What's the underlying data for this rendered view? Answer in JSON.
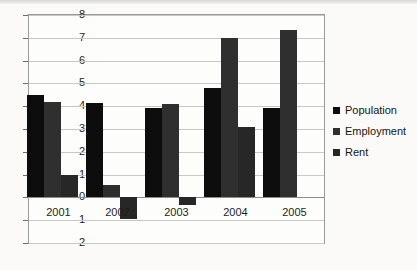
{
  "chart_data": {
    "type": "bar",
    "title": "",
    "subtitle": "",
    "xlabel": "",
    "ylabel": "",
    "categories": [
      "2001",
      "2002",
      "2003",
      "2004",
      "2005"
    ],
    "series": [
      {
        "name": "Population",
        "values": [
          4.5,
          4.15,
          3.9,
          4.8,
          3.9
        ],
        "color": "#0d0d0d"
      },
      {
        "name": "Employment",
        "values": [
          4.2,
          0.55,
          4.1,
          7.0,
          7.35
        ],
        "color": "#2f2f2f"
      },
      {
        "name": "Rent",
        "values": [
          1.0,
          -0.95,
          -0.35,
          3.1,
          0.0
        ],
        "color": "#272727"
      }
    ],
    "ylim": [
      -2,
      8
    ],
    "yticks": [
      8,
      7,
      6,
      5,
      4,
      3,
      2,
      1,
      0,
      -1,
      -2
    ],
    "ytick_labels": [
      "8",
      "7",
      "6",
      "5",
      "4",
      "3",
      "2",
      "1",
      "0",
      "-1",
      "-2"
    ],
    "grid": true,
    "grid_axis": "y",
    "legend_position": "right",
    "bar_grouping": "clustered"
  },
  "legend": {
    "items": [
      {
        "label": "Population"
      },
      {
        "label": "Employment"
      },
      {
        "label": "Rent"
      }
    ]
  }
}
